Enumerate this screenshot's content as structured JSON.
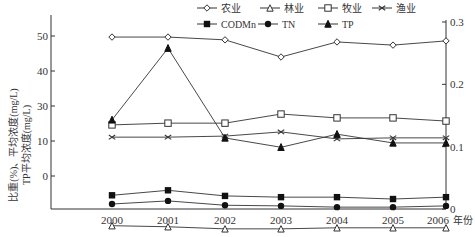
{
  "chart_data": {
    "type": "line",
    "title": "",
    "xlabel": "年份",
    "ylabel_left": "比重(%)、平均浓度(mg/L)",
    "ylabel_left_line2": "TP平均浓度(mg/L)",
    "x": [
      "2000",
      "2001",
      "2002",
      "2003",
      "2004",
      "2005",
      "2006"
    ],
    "left_axis": {
      "tick_labels": [
        "50",
        "40",
        "30",
        "10",
        "0"
      ],
      "ylim": [
        -9.5,
        54
      ]
    },
    "right_axis": {
      "tick_labels": [
        "0.3",
        "0.2",
        "0.1",
        "0"
      ],
      "ticks": [
        0.3,
        0.2,
        0.1,
        0
      ],
      "ylim": [
        0,
        0.3
      ]
    },
    "grid": false,
    "legend_position": "top-right",
    "series": [
      {
        "name": "农业",
        "axis": "left",
        "marker": "open-diamond",
        "values": [
          49.7,
          49.7,
          48.9,
          44.0,
          48.3,
          47.4,
          48.6
        ]
      },
      {
        "name": "林业",
        "axis": "left",
        "marker": "open-triangle",
        "values": [
          -4.2,
          -4.5,
          -5.1,
          -5.1,
          -4.8,
          -4.8,
          -4.8
        ]
      },
      {
        "name": "牧业",
        "axis": "left",
        "marker": "open-square",
        "values": [
          24.6,
          25.1,
          25.1,
          27.7,
          26.6,
          26.6,
          25.7
        ]
      },
      {
        "name": "渔业",
        "axis": "left",
        "marker": "cross",
        "values": [
          21.1,
          21.1,
          21.4,
          22.6,
          20.6,
          20.9,
          20.9
        ]
      },
      {
        "name": "CODMn",
        "axis": "right",
        "marker": "filled-square",
        "values": [
          0.022,
          0.03,
          0.021,
          0.019,
          0.019,
          0.016,
          0.019
        ]
      },
      {
        "name": "TN",
        "axis": "right",
        "marker": "filled-circle",
        "values": [
          0.008,
          0.013,
          0.006,
          0.005,
          0.003,
          0.003,
          0.005
        ]
      },
      {
        "name": "TP",
        "axis": "right",
        "marker": "filled-triangle",
        "values": [
          0.143,
          0.258,
          0.114,
          0.099,
          0.12,
          0.106,
          0.106
        ]
      }
    ]
  }
}
